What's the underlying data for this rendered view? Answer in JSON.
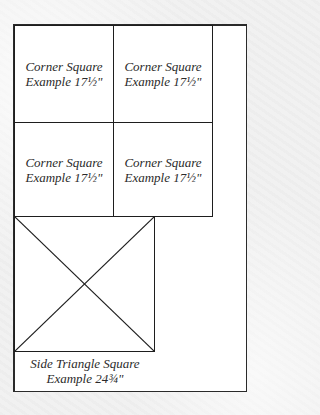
{
  "diagram": {
    "type": "quilt-layout",
    "colors": {
      "line": "#1e1e1e",
      "fill": "#ffffff",
      "background": "#f1f1f1",
      "text": "#2b2b2b"
    },
    "corner_squares": [
      {
        "line1": "Corner Square",
        "line2": "Example 17½\""
      },
      {
        "line1": "Corner Square",
        "line2": "Example 17½\""
      },
      {
        "line1": "Corner Square",
        "line2": "Example 17½\""
      },
      {
        "line1": "Corner Square",
        "line2": "Example 17½\""
      }
    ],
    "side_triangle_square": {
      "line1": "Side Triangle Square",
      "line2": "Example 24¾\""
    }
  }
}
